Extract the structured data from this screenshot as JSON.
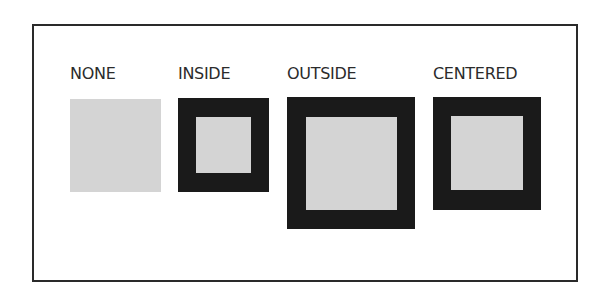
{
  "diagram": {
    "items": [
      {
        "label": "NONE",
        "stroke": "none"
      },
      {
        "label": "INSIDE",
        "stroke": "inside"
      },
      {
        "label": "OUTSIDE",
        "stroke": "outside"
      },
      {
        "label": "CENTERED",
        "stroke": "centered"
      }
    ],
    "colors": {
      "fill": "#d4d4d4",
      "stroke": "#1a1a1a",
      "frame": "#2a2a2a"
    }
  }
}
